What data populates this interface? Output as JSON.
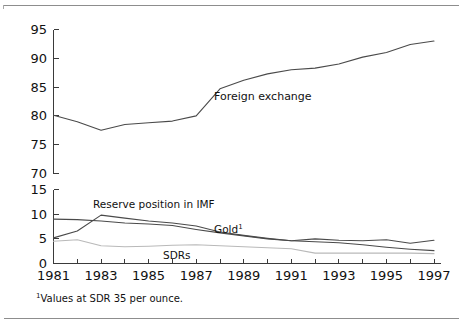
{
  "figure": {
    "footnote": "¹Values at SDR 35 per ounce.",
    "footnote_marker": "1",
    "footnote_text": "Values at SDR 35 per ounce.",
    "background_color": "#ffffff",
    "line_color": "#4a4a4a",
    "rule_color": "#8d8d8d"
  },
  "chart_data": [
    {
      "type": "line",
      "panel": "upper",
      "title": "",
      "xlabel": "",
      "ylabel": "",
      "grid": false,
      "legend": "inline-annotations",
      "xlim": [
        1981,
        1997
      ],
      "ylim": [
        70,
        95
      ],
      "yticks": [
        70,
        75,
        80,
        85,
        90,
        95
      ],
      "xticks": [
        1981,
        1982,
        1983,
        1984,
        1985,
        1986,
        1987,
        1988,
        1989,
        1990,
        1991,
        1992,
        1993,
        1994,
        1995,
        1996,
        1997
      ],
      "xticklabels": [
        "1981",
        "",
        "1983",
        "",
        "1985",
        "",
        "1987",
        "",
        "1989",
        "",
        "1991",
        "",
        "1993",
        "",
        "1995",
        "",
        "1997"
      ],
      "x": [
        1981,
        1982,
        1983,
        1984,
        1985,
        1986,
        1987,
        1988,
        1989,
        1990,
        1991,
        1992,
        1993,
        1994,
        1995,
        1996,
        1997
      ],
      "series": [
        {
          "name": "Foreign exchange",
          "label": "Foreign exchange",
          "values": [
            80.1,
            79.0,
            77.5,
            78.5,
            78.8,
            79.1,
            80.0,
            84.7,
            86.2,
            87.3,
            88.0,
            88.3,
            89.0,
            90.2,
            91.0,
            92.4,
            93.0
          ]
        }
      ]
    },
    {
      "type": "line",
      "panel": "lower",
      "title": "",
      "xlabel": "",
      "ylabel": "",
      "grid": false,
      "legend": "inline-annotations",
      "xlim": [
        1981,
        1997
      ],
      "ylim": [
        0,
        15
      ],
      "yticks": [
        0,
        5,
        10,
        15
      ],
      "xticks": [
        1981,
        1982,
        1983,
        1984,
        1985,
        1986,
        1987,
        1988,
        1989,
        1990,
        1991,
        1992,
        1993,
        1994,
        1995,
        1996,
        1997
      ],
      "xticklabels": [
        "1981",
        "",
        "1983",
        "",
        "1985",
        "",
        "1987",
        "",
        "1989",
        "",
        "1991",
        "",
        "1993",
        "",
        "1995",
        "",
        "1997"
      ],
      "x": [
        1981,
        1982,
        1983,
        1984,
        1985,
        1986,
        1987,
        1988,
        1989,
        1990,
        1991,
        1992,
        1993,
        1994,
        1995,
        1996,
        1997
      ],
      "series": [
        {
          "name": "Gold",
          "label": "Gold",
          "label_superscript": "1",
          "values": [
            9.0,
            8.9,
            8.6,
            8.2,
            8.0,
            7.7,
            6.9,
            6.2,
            5.6,
            5.0,
            4.6,
            4.4,
            4.2,
            3.8,
            3.3,
            2.9,
            2.6
          ]
        },
        {
          "name": "Reserve position in IMF",
          "label": "Reserve position in IMF",
          "values": [
            5.2,
            6.6,
            9.8,
            9.2,
            8.6,
            8.2,
            7.6,
            6.4,
            5.7,
            5.1,
            4.6,
            5.0,
            4.7,
            4.6,
            4.8,
            4.1,
            4.7
          ]
        },
        {
          "name": "SDRs",
          "label": "SDRs",
          "values": [
            4.5,
            4.8,
            3.6,
            3.4,
            3.5,
            3.7,
            3.8,
            3.6,
            3.4,
            3.2,
            3.0,
            2.1,
            2.1,
            2.1,
            2.1,
            2.1,
            2.0
          ]
        }
      ]
    }
  ]
}
